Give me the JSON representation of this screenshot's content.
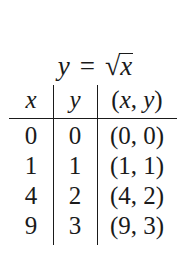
{
  "title": {
    "lhs": "y",
    "equals": "=",
    "radical": "√",
    "radicand": "x"
  },
  "table": {
    "headers": {
      "x": "x",
      "y": "y",
      "pair_open": "(",
      "pair_x": "x",
      "pair_sep": ", ",
      "pair_y": "y",
      "pair_close": ")"
    },
    "rows": [
      {
        "x": "0",
        "y": "0",
        "pair": "(0, 0)"
      },
      {
        "x": "1",
        "y": "1",
        "pair": "(1, 1)"
      },
      {
        "x": "4",
        "y": "2",
        "pair": "(4, 2)"
      },
      {
        "x": "9",
        "y": "3",
        "pair": "(9, 3)"
      }
    ]
  }
}
